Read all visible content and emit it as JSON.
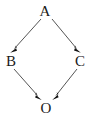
{
  "diagram": {
    "type": "directed-acyclic-graph",
    "shape": "diamond",
    "background_color": "#ffffff",
    "edge_color": "#555555",
    "arrow_color": "#111111",
    "label_color": "#1a1a1a",
    "nodes": [
      {
        "id": "A",
        "label": "A",
        "x": 45,
        "y": 11,
        "role": "source"
      },
      {
        "id": "B",
        "label": "B",
        "x": 11,
        "y": 61,
        "role": "intermediate"
      },
      {
        "id": "C",
        "label": "C",
        "x": 80,
        "y": 61,
        "role": "intermediate"
      },
      {
        "id": "O",
        "label": "O",
        "x": 46,
        "y": 108,
        "role": "sink"
      }
    ],
    "edges": [
      {
        "id": "A-to-B",
        "from": "A",
        "to": "B",
        "directed": true,
        "x1": 40,
        "y1": 20,
        "x2": 13,
        "y2": 50
      },
      {
        "id": "A-to-C",
        "from": "A",
        "to": "C",
        "directed": true,
        "x1": 52,
        "y1": 20,
        "x2": 78,
        "y2": 50
      },
      {
        "id": "B-to-O",
        "from": "B",
        "to": "O",
        "directed": true,
        "x1": 15,
        "y1": 70,
        "x2": 40,
        "y2": 98
      },
      {
        "id": "C-to-O",
        "from": "C",
        "to": "O",
        "directed": true,
        "x1": 76,
        "y1": 70,
        "x2": 54,
        "y2": 98
      }
    ]
  }
}
